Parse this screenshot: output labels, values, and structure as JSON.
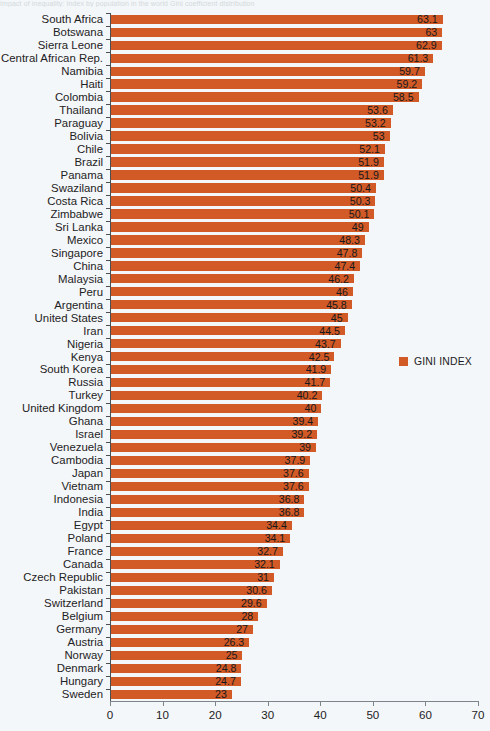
{
  "caption": "Impact of inequality: Index by population in the world Gini coefficient distribution",
  "legend": {
    "label": "GINI INDEX",
    "color": "#d15a27",
    "position": "right-middle"
  },
  "axis": {
    "xticks": [
      0,
      10,
      20,
      30,
      40,
      50,
      60,
      70
    ],
    "xmin": 0,
    "xmax": 70
  },
  "chart_data": {
    "type": "bar",
    "orientation": "horizontal",
    "title": "",
    "subtitle": "",
    "xlabel": "",
    "ylabel": "",
    "xlim": [
      0,
      70
    ],
    "grid": false,
    "legend": [
      "GINI INDEX"
    ],
    "series_color": "#d15a27",
    "categories": [
      "South Africa",
      "Botswana",
      "Sierra Leone",
      "Central African Rep.",
      "Namibia",
      "Haiti",
      "Colombia",
      "Thailand",
      "Paraguay",
      "Bolivia",
      "Chile",
      "Brazil",
      "Panama",
      "Swaziland",
      "Costa Rica",
      "Zimbabwe",
      "Sri Lanka",
      "Mexico",
      "Singapore",
      "China",
      "Malaysia",
      "Peru",
      "Argentina",
      "United States",
      "Iran",
      "Nigeria",
      "Kenya",
      "South Korea",
      "Russia",
      "Turkey",
      "United Kingdom",
      "Ghana",
      "Israel",
      "Venezuela",
      "Cambodia",
      "Japan",
      "Vietnam",
      "Indonesia",
      "India",
      "Egypt",
      "Poland",
      "France",
      "Canada",
      "Czech Republic",
      "Pakistan",
      "Switzerland",
      "Belgium",
      "Germany",
      "Austria",
      "Norway",
      "Denmark",
      "Hungary",
      "Sweden"
    ],
    "values": [
      63.1,
      63,
      62.9,
      61.3,
      59.7,
      59.2,
      58.5,
      53.6,
      53.2,
      53,
      52.1,
      51.9,
      51.9,
      50.4,
      50.3,
      50.1,
      49,
      48.3,
      47.8,
      47.4,
      46.2,
      46,
      45.8,
      45,
      44.5,
      43.7,
      42.5,
      41.9,
      41.7,
      40.2,
      40,
      39.4,
      39.2,
      39,
      37.9,
      37.6,
      37.6,
      36.8,
      36.8,
      34.4,
      34.1,
      32.7,
      32.1,
      31,
      30.6,
      29.6,
      28,
      27,
      26.3,
      25,
      24.8,
      24.7,
      23
    ],
    "value_labels": [
      "63.1",
      "63",
      "62.9",
      "61.3",
      "59.7",
      "59.2",
      "58.5",
      "53.6",
      "53.2",
      "53",
      "52.1",
      "51.9",
      "51.9",
      "50.4",
      "50.3",
      "50.1",
      "49",
      "48.3",
      "47.8",
      "47.4",
      "46.2",
      "46",
      "45.8",
      "45",
      "44.5",
      "43.7",
      "42.5",
      "41.9",
      "41.7",
      "40.2",
      "40",
      "39.4",
      "39.2",
      "39",
      "37.9",
      "37.6",
      "37.6",
      "36.8",
      "36.8",
      "34.4",
      "34.1",
      "32.7",
      "32.1",
      "31",
      "30.6",
      "29.6",
      "28",
      "27",
      "26.3",
      "25",
      "24.8",
      "24.7",
      "23"
    ]
  }
}
